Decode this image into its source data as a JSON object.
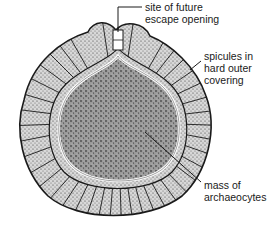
{
  "diagram": {
    "labels": [
      {
        "id": "escape-opening",
        "lines": [
          "site of future",
          "escape opening"
        ]
      },
      {
        "id": "spicules",
        "lines": [
          "spicules in",
          "hard outer",
          "covering"
        ]
      },
      {
        "id": "archaeocytes",
        "lines": [
          "mass of",
          "archaeocytes"
        ]
      }
    ]
  },
  "colors": {
    "background": "#ffffff",
    "ink": "#1a1a1a",
    "stipple_fill": "#b9b9b9",
    "mass_fill": "#8f8f8f"
  }
}
